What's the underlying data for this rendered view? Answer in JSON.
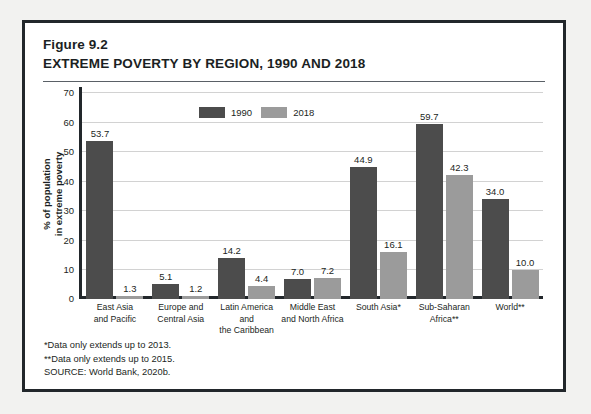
{
  "figure": {
    "number": "Figure 9.2",
    "title": "EXTREME POVERTY BY REGION, 1990 AND 2018"
  },
  "footnotes": [
    "*Data only extends up to 2013.",
    "**Data only extends up to 2015.",
    "SOURCE: World Bank, 2020b."
  ],
  "colors": {
    "series_1990": "#4c4c4c",
    "series_2018": "#9b9b9b",
    "frame": "#22272b",
    "gridline": "#d2d2d2",
    "page_background": "#f2f2f0",
    "panel_background": "#ffffff",
    "text": "#1b1f23"
  },
  "chart_data": {
    "type": "bar",
    "title": "EXTREME POVERTY BY REGION, 1990 AND 2018",
    "subtitle": "Figure 9.2",
    "xlabel": "",
    "ylabel": "% of population\nin extreme poverty",
    "ylim": [
      0,
      70
    ],
    "yticks": [
      0,
      10,
      20,
      30,
      40,
      50,
      60,
      70
    ],
    "ytick_labels": [
      "0",
      "10",
      "20",
      "30",
      "40",
      "50",
      "60",
      "70"
    ],
    "grid": true,
    "legend_position": "top-center",
    "categories": [
      "East Asia\nand Pacific",
      "Europe and\nCentral Asia",
      "Latin America and\nthe Caribbean",
      "Middle East\nand North Africa",
      "South Asia*",
      "Sub-Saharan\nAfrica**",
      "World**"
    ],
    "series": [
      {
        "name": "1990",
        "color": "#4c4c4c",
        "values": [
          53.7,
          5.1,
          14.2,
          7.0,
          44.9,
          59.7,
          34.0
        ],
        "labels": [
          "53.7",
          "5.1",
          "14.2",
          "7.0",
          "44.9",
          "59.7",
          "34.0"
        ]
      },
      {
        "name": "2018",
        "color": "#9b9b9b",
        "values": [
          1.3,
          1.2,
          4.4,
          7.2,
          16.1,
          42.3,
          10.0
        ],
        "labels": [
          "1.3",
          "1.2",
          "4.4",
          "7.2",
          "16.1",
          "42.3",
          "10.0"
        ]
      }
    ]
  }
}
